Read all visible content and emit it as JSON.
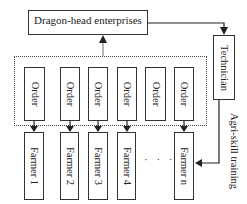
{
  "diagram": {
    "top_node": "Dragon-head enterprises",
    "technician": "Technician",
    "training_label": "Agri-skill training",
    "orders": [
      "Order",
      "Order",
      "Order",
      "Order",
      "Order",
      "Order"
    ],
    "farmers": [
      "Farmer 1",
      "Farmer 2",
      "Farmer 3",
      "Farmer 4",
      "Farmer n"
    ],
    "ellipsis": "· · ·"
  }
}
